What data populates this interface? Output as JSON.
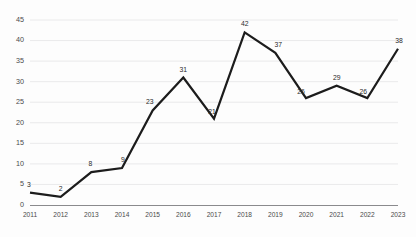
{
  "chart_data": {
    "type": "line",
    "title": "",
    "xlabel": "",
    "ylabel": "",
    "categories": [
      "2011",
      "2012",
      "2013",
      "2014",
      "2015",
      "2016",
      "2017",
      "2018",
      "2019",
      "2020",
      "2021",
      "2022",
      "2023"
    ],
    "values": [
      3,
      2,
      8,
      9,
      23,
      31,
      21,
      42,
      37,
      26,
      29,
      26,
      38
    ],
    "series": [
      {
        "name": "",
        "values": [
          3,
          2,
          8,
          9,
          23,
          31,
          21,
          42,
          37,
          26,
          29,
          26,
          38
        ]
      }
    ],
    "data_labels": [
      "3",
      "2",
      "8",
      "9",
      "23",
      "31",
      "21",
      "42",
      "37",
      "26",
      "29",
      "26",
      "38"
    ],
    "ylim": [
      0,
      45
    ],
    "y_ticks": [
      0,
      5,
      10,
      15,
      20,
      25,
      30,
      35,
      40,
      45
    ],
    "y_tick_labels": [
      "0",
      "5",
      "10",
      "15",
      "20",
      "25",
      "30",
      "35",
      "40",
      "45"
    ],
    "grid": true,
    "grid_axis": "y",
    "legend": false,
    "legend_position": "none",
    "line_color": "#1c1c1c",
    "grid_color": "#e4e4e6",
    "axis_color": "#8a8a8d",
    "background_color": "#fdfdfd",
    "show_markers": false,
    "show_data_labels": true
  }
}
